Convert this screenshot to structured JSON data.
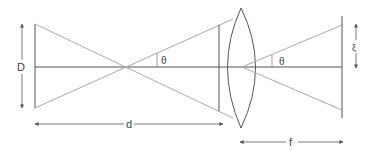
{
  "diagram": {
    "type": "optics-lens-diagram",
    "labels": {
      "object_size": "D",
      "object_distance": "d",
      "focal_length": "f",
      "angle_left": "θ",
      "angle_right": "θ",
      "image_offset": "ξ"
    },
    "colors": {
      "line": "#555555",
      "ray": "#aaaaaa",
      "text": "#444444"
    }
  }
}
